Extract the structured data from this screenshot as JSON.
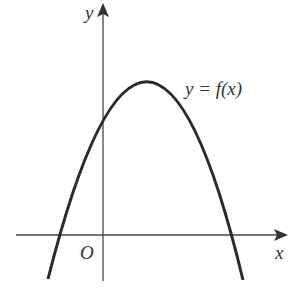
{
  "diagram": {
    "type": "function-graph",
    "axes": {
      "x_label": "x",
      "y_label": "y",
      "origin_label": "O"
    },
    "curve": {
      "label": "y = f(x)",
      "shape": "downward parabola",
      "vertex_px": [
        148,
        80
      ],
      "x_intercepts_px": [
        59,
        232
      ],
      "y_intercept_px": [
        103,
        118
      ]
    },
    "colors": {
      "stroke": "#2a2a2a",
      "axis": "#444444",
      "background": "#ffffff"
    }
  }
}
